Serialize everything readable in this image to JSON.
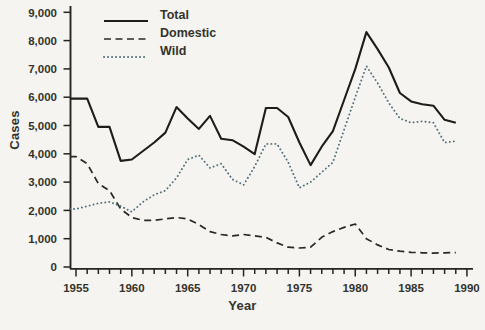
{
  "chart_data": {
    "type": "line",
    "title": "",
    "xlabel": "Year",
    "ylabel": "Cases",
    "xlim": [
      1954.5,
      1990.5
    ],
    "ylim": [
      0,
      9000
    ],
    "grid": false,
    "legend_position": "upper-left-inside",
    "xticks": [
      1955,
      1960,
      1965,
      1970,
      1975,
      1980,
      1985,
      1990
    ],
    "xtick_minor_every": 1,
    "yticks": [
      {
        "value": 0,
        "label": "0"
      },
      {
        "value": 1000,
        "label": "1,000"
      },
      {
        "value": 2000,
        "label": "2,000"
      },
      {
        "value": 3000,
        "label": "3,000"
      },
      {
        "value": 4000,
        "label": "4,000"
      },
      {
        "value": 5000,
        "label": "5,000"
      },
      {
        "value": 6000,
        "label": "6,000"
      },
      {
        "value": 7000,
        "label": "7,000"
      },
      {
        "value": 8000,
        "label": "8,000"
      },
      {
        "value": 9000,
        "label": "9,000"
      }
    ],
    "x": [
      1955,
      1956,
      1957,
      1958,
      1959,
      1960,
      1961,
      1962,
      1963,
      1964,
      1965,
      1966,
      1967,
      1968,
      1969,
      1970,
      1971,
      1972,
      1973,
      1974,
      1975,
      1976,
      1977,
      1978,
      1979,
      1980,
      1981,
      1982,
      1983,
      1984,
      1985,
      1986,
      1987,
      1988,
      1989
    ],
    "series": [
      {
        "name": "Total",
        "style": "solid",
        "color": "#1e1d1a",
        "values": [
          5950,
          5950,
          4950,
          4950,
          3750,
          3800,
          4100,
          4400,
          4750,
          5650,
          5250,
          4880,
          5340,
          4530,
          4480,
          4250,
          3990,
          5620,
          5620,
          5300,
          4400,
          3600,
          4250,
          4800,
          5900,
          7000,
          8300,
          7700,
          7050,
          6150,
          5850,
          5750,
          5700,
          5200,
          5100
        ]
      },
      {
        "name": "Domestic",
        "style": "dashed",
        "color": "#2a2924",
        "values": [
          3900,
          3650,
          2950,
          2700,
          2050,
          1750,
          1650,
          1650,
          1700,
          1750,
          1700,
          1500,
          1250,
          1150,
          1100,
          1150,
          1100,
          1050,
          850,
          700,
          670,
          700,
          1050,
          1250,
          1400,
          1520,
          1000,
          780,
          620,
          560,
          520,
          500,
          490,
          500,
          510
        ]
      },
      {
        "name": "Wild",
        "style": "dotted",
        "color": "#4d6e7a",
        "values": [
          2050,
          2150,
          2250,
          2300,
          2150,
          1950,
          2300,
          2550,
          2700,
          3150,
          3800,
          3950,
          3500,
          3650,
          3100,
          2900,
          3550,
          4350,
          4350,
          3700,
          2800,
          3000,
          3350,
          3700,
          4850,
          6000,
          7100,
          6500,
          5800,
          5250,
          5100,
          5150,
          5100,
          4400,
          4450
        ]
      }
    ]
  }
}
